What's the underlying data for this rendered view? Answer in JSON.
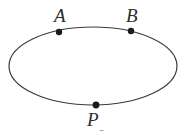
{
  "figure": {
    "type": "geometry-diagram",
    "background_color": "#ffffff",
    "stroke_color": "#3a3a3a",
    "stroke_width": 1.2,
    "point_color": "#1a1a1a",
    "label_color": "#2e2e2e",
    "ellipse": {
      "center_x": 93,
      "center_y": 66,
      "radius_x": 84,
      "radius_y": 39
    },
    "points": [
      {
        "id": "A",
        "label": "A",
        "x": 59,
        "y": 32,
        "radius": 3.2,
        "label_position": "above-left"
      },
      {
        "id": "B",
        "label": "B",
        "x": 131,
        "y": 31,
        "radius": 3.2,
        "label_position": "above-right"
      },
      {
        "id": "P",
        "label": "P",
        "sublabel": "o",
        "x": 96,
        "y": 105,
        "radius": 3.4,
        "label_position": "below",
        "clipped": true
      }
    ]
  }
}
